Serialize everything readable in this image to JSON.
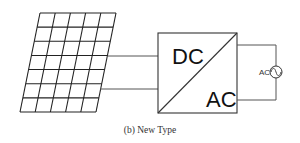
{
  "diagram": {
    "panel": {
      "columns": 5,
      "rows": 7
    },
    "converter": {
      "input_label": "DC",
      "output_label": "AC"
    },
    "source": {
      "label": "AC"
    },
    "caption": "(b) New Type"
  }
}
